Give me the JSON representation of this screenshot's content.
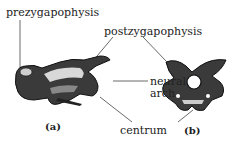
{
  "diagram": {
    "labels": {
      "prezygapophysis": "prezygapophysis",
      "postzygapophysis": "postzygapophysis",
      "neural_arch_line1": "neural",
      "neural_arch_line2": "arch",
      "centrum": "centrum"
    },
    "captions": {
      "a": "(a)",
      "b": "(b)"
    },
    "views": [
      {
        "id": "a",
        "description": "lateral view of vertebra"
      },
      {
        "id": "b",
        "description": "anterior view of vertebra"
      }
    ]
  }
}
